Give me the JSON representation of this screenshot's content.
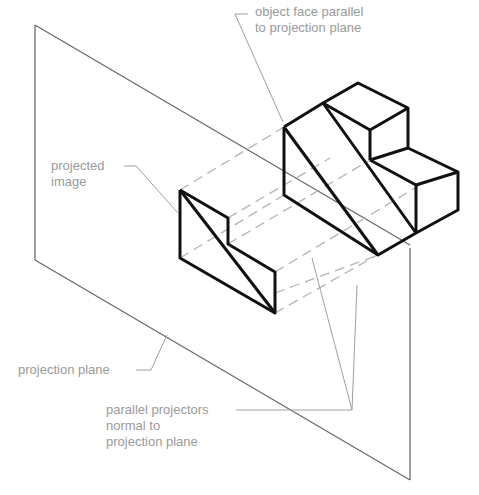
{
  "diagram": {
    "colors": {
      "object_stroke": "#111111",
      "plane_stroke": "#6a6a6a",
      "projector_dash": "#b5b5b5",
      "leader": "#a0a0a0",
      "label_text": "#9a9a9a",
      "background": "#ffffff"
    },
    "labels": {
      "object_face": {
        "line1": "object face parallel",
        "line2": "to projection plane"
      },
      "projected_image": {
        "line1": "projected",
        "line2": "image"
      },
      "projection_plane": {
        "line1": "projection plane"
      },
      "parallel_projectors": {
        "line1": "parallel projectors",
        "line2": "normal to",
        "line3": "projection plane"
      }
    },
    "elements": [
      {
        "name": "projection-plane",
        "type": "parallelogram"
      },
      {
        "name": "object",
        "type": "stepped-block-with-inclined-face"
      },
      {
        "name": "projected-image",
        "type": "L-shaped outline with diagonal"
      },
      {
        "name": "projectors",
        "type": "dashed parallel lines"
      }
    ]
  }
}
